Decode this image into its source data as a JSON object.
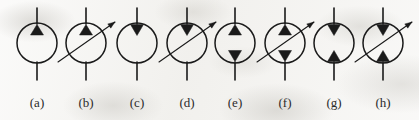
{
  "figure": {
    "background_color": "#f2f1ee",
    "ink_color": "#1a1a1a",
    "label_color": "#2b2b2b",
    "width": 419,
    "height": 120
  },
  "geometry": {
    "circle_radius": 20,
    "circle_center_y": 43,
    "lead_top_y": 8,
    "lead_bottom_y": 80,
    "label_y": 96,
    "centers_x": [
      37,
      86,
      137,
      187,
      235,
      285,
      334,
      383
    ]
  },
  "symbols": [
    {
      "label": "(a)",
      "name": "source-up-arrow",
      "center_x": 37,
      "top_marker": "triangle-up",
      "bottom_marker": "none",
      "diagonal_arrow": false
    },
    {
      "label": "(b)",
      "name": "variable-source-up-arrow",
      "center_x": 86,
      "top_marker": "triangle-up",
      "bottom_marker": "none",
      "diagonal_arrow": true
    },
    {
      "label": "(c)",
      "name": "source-down-arrow",
      "center_x": 137,
      "top_marker": "triangle-down",
      "bottom_marker": "none",
      "diagonal_arrow": false
    },
    {
      "label": "(d)",
      "name": "variable-source-down-arrow",
      "center_x": 187,
      "top_marker": "triangle-down",
      "bottom_marker": "none",
      "diagonal_arrow": true
    },
    {
      "label": "(e)",
      "name": "source-diverging-arrows",
      "center_x": 235,
      "top_marker": "triangle-up",
      "bottom_marker": "triangle-down",
      "diagonal_arrow": false
    },
    {
      "label": "(f)",
      "name": "variable-source-diverging-arrows",
      "center_x": 285,
      "top_marker": "triangle-up",
      "bottom_marker": "triangle-down",
      "diagonal_arrow": true
    },
    {
      "label": "(g)",
      "name": "source-converging-arrows",
      "center_x": 334,
      "top_marker": "triangle-down",
      "bottom_marker": "triangle-up",
      "diagonal_arrow": false
    },
    {
      "label": "(h)",
      "name": "variable-source-converging-arrows",
      "center_x": 383,
      "top_marker": "triangle-down",
      "bottom_marker": "triangle-up",
      "diagonal_arrow": true
    }
  ]
}
